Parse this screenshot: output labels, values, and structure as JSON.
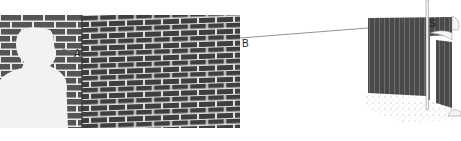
{
  "labels": {
    "a": "A",
    "b": "B",
    "s": "S"
  },
  "colors": {
    "brick": "#555555",
    "brick_dark": "#3e3e3e",
    "mortar": "#e8e8e8",
    "fence": "#4a4a4a",
    "fence_line": "#6e6e6e",
    "silhouette": "#f2f2f2",
    "sight_line": "#777777"
  }
}
